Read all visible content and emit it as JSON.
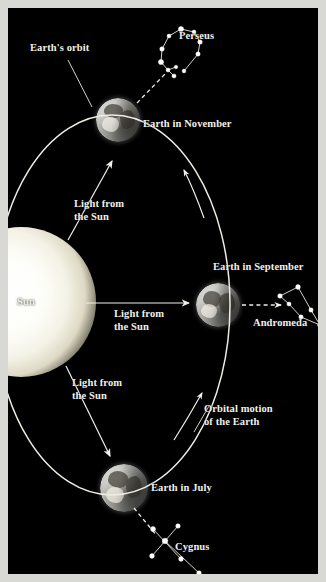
{
  "figure": {
    "background_color": "#000000",
    "frame_color": "#d8d8d4",
    "text_color": "#f2f0ea",
    "width": 326,
    "height": 582
  },
  "labels": {
    "earths_orbit": "Earth's orbit",
    "perseus": "Perseus",
    "earth_november": "Earth in November",
    "light_from_sun_upper": "Light from\nthe Sun",
    "sun": "Sun",
    "light_from_sun_middle": "Light from\nthe Sun",
    "earth_september": "Earth in September",
    "andromeda": "Andromeda",
    "light_from_sun_lower": "Light from\nthe Sun",
    "orbital_motion": "Orbital motion\nof the Earth",
    "earth_july": "Earth in July",
    "cygnus": "Cygnus"
  },
  "bodies": {
    "sun": {
      "name": "Sun",
      "cx": 12,
      "cy": 293,
      "r": 72,
      "color": "#fdfdf8"
    },
    "earth_november": {
      "name": "Earth in November",
      "cx": 114,
      "cy": 116,
      "r": 22
    },
    "earth_september": {
      "name": "Earth in September",
      "cx": 210,
      "cy": 297,
      "r": 22
    },
    "earth_july": {
      "name": "Earth in July",
      "cx": 116,
      "cy": 480,
      "r": 24
    }
  },
  "orbit": {
    "type": "ellipse",
    "cx": 104,
    "cy": 297,
    "rx": 118,
    "ry": 190,
    "stroke": "#efece3"
  },
  "constellations": [
    {
      "name": "Perseus",
      "stars": [
        [
          173,
          21
        ],
        [
          161,
          28
        ],
        [
          154,
          41
        ],
        [
          153,
          54
        ],
        [
          160,
          62
        ],
        [
          168,
          59
        ],
        [
          166,
          68
        ],
        [
          186,
          24
        ],
        [
          192,
          34
        ],
        [
          190,
          46
        ],
        [
          176,
          63
        ]
      ],
      "lines": [
        [
          [
            173,
            21
          ],
          [
            161,
            28
          ]
        ],
        [
          [
            161,
            28
          ],
          [
            154,
            41
          ]
        ],
        [
          [
            154,
            41
          ],
          [
            153,
            54
          ]
        ],
        [
          [
            153,
            54
          ],
          [
            160,
            62
          ]
        ],
        [
          [
            160,
            62
          ],
          [
            168,
            59
          ]
        ],
        [
          [
            160,
            62
          ],
          [
            166,
            68
          ]
        ],
        [
          [
            173,
            21
          ],
          [
            186,
            24
          ]
        ],
        [
          [
            186,
            24
          ],
          [
            192,
            34
          ]
        ],
        [
          [
            192,
            34
          ],
          [
            190,
            46
          ]
        ],
        [
          [
            190,
            46
          ],
          [
            176,
            63
          ]
        ]
      ]
    },
    {
      "name": "Andromeda",
      "stars": [
        [
          290,
          279
        ],
        [
          272,
          288
        ],
        [
          303,
          302
        ],
        [
          281,
          296
        ],
        [
          293,
          309
        ],
        [
          312,
          317
        ]
      ],
      "lines": [
        [
          [
            272,
            288
          ],
          [
            290,
            279
          ]
        ],
        [
          [
            290,
            279
          ],
          [
            303,
            302
          ]
        ],
        [
          [
            303,
            302
          ],
          [
            312,
            317
          ]
        ],
        [
          [
            272,
            288
          ],
          [
            281,
            296
          ]
        ],
        [
          [
            281,
            296
          ],
          [
            293,
            309
          ]
        ],
        [
          [
            293,
            309
          ],
          [
            312,
            317
          ]
        ]
      ]
    },
    {
      "name": "Cygnus",
      "stars": [
        [
          145,
          521
        ],
        [
          170,
          518
        ],
        [
          157,
          533
        ],
        [
          144,
          548
        ],
        [
          173,
          551
        ],
        [
          191,
          565
        ]
      ],
      "lines": [
        [
          [
            145,
            521
          ],
          [
            173,
            551
          ]
        ],
        [
          [
            170,
            518
          ],
          [
            144,
            548
          ]
        ],
        [
          [
            157,
            533
          ],
          [
            191,
            565
          ]
        ]
      ]
    }
  ],
  "sunlight_rays": [
    {
      "name": "ray-to-november",
      "from": [
        64,
        224
      ],
      "to": [
        104,
        152
      ]
    },
    {
      "name": "ray-to-september",
      "from": [
        80,
        295
      ],
      "to": [
        182,
        295
      ]
    },
    {
      "name": "ray-to-july",
      "from": [
        62,
        366
      ],
      "to": [
        101,
        447
      ]
    }
  ],
  "sightlines": [
    {
      "name": "november-to-perseus",
      "from": [
        128,
        96
      ],
      "to": [
        156,
        67
      ]
    },
    {
      "name": "september-to-andromeda",
      "from": [
        235,
        297
      ],
      "to": [
        272,
        297
      ]
    },
    {
      "name": "july-to-cygnus",
      "from": [
        126,
        500
      ],
      "to": [
        148,
        527
      ]
    }
  ],
  "motion_arrows": [
    {
      "name": "orbit-arrow-upper",
      "position": [
        185,
        170
      ]
    },
    {
      "name": "orbit-arrow-lower",
      "position": [
        181,
        405
      ]
    }
  ]
}
